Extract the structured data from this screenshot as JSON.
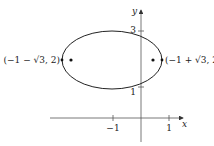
{
  "diagram": {
    "type": "ellipse-on-axes",
    "axes": {
      "x_label": "x",
      "y_label": "y",
      "x_ticks": [
        {
          "value": -1,
          "label": "−1"
        },
        {
          "value": 1,
          "label": "1"
        }
      ],
      "y_ticks": [
        {
          "value": 1,
          "label": "1"
        },
        {
          "value": 3,
          "label": "3"
        }
      ]
    },
    "ellipse": {
      "center": [
        -1,
        2
      ],
      "vertices": [
        {
          "label": "(−1 − √3, 2)"
        },
        {
          "label": "(−1 + √3, 2)"
        }
      ],
      "foci_marked": true
    },
    "colors": {
      "stroke": "#222222",
      "axis": "#555555",
      "background": "#ffffff"
    }
  }
}
